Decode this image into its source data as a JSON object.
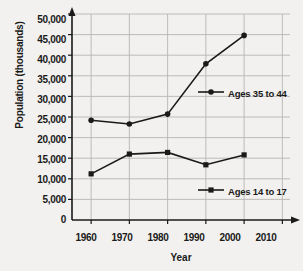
{
  "chart_data": {
    "type": "line",
    "title": "",
    "xlabel": "Year",
    "ylabel": "Population (thousands)",
    "x": [
      1960,
      1970,
      1980,
      1990,
      2000
    ],
    "xticks": [
      "1960",
      "1970",
      "1980",
      "1990",
      "2000",
      "2010"
    ],
    "xlim": [
      1955,
      2012
    ],
    "yticks": [
      "0",
      "5,000",
      "10,000",
      "15,000",
      "20,000",
      "25,000",
      "30,000",
      "35,000",
      "40,000",
      "45,000",
      "50,000"
    ],
    "ylim": [
      0,
      50000
    ],
    "grid": true,
    "legend_position": "inside-right",
    "series": [
      {
        "name": "Ages 35 to 44",
        "marker": "circle",
        "values": [
          24200,
          23300,
          25700,
          37900,
          44800
        ]
      },
      {
        "name": "Ages 14 to 17",
        "marker": "square",
        "values": [
          11200,
          16000,
          16400,
          13400,
          15800
        ]
      }
    ],
    "colors": {
      "line": "#1a1a1a",
      "grid": "#b8b6b2",
      "axis": "#1a1a1a",
      "background": "#f2f1ef",
      "text": "#1a1a1a"
    }
  },
  "axis": {
    "y_title": "Population (thousands)",
    "x_title": "Year"
  },
  "legend": {
    "entries": [
      {
        "label": "Ages 35 to 44",
        "marker": "circle-marker"
      },
      {
        "label": "Ages 14 to 17",
        "marker": "square-marker"
      }
    ]
  }
}
